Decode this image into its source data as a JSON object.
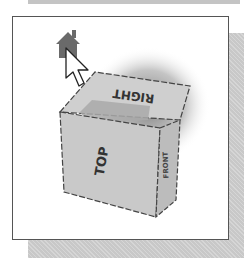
{
  "figure": {
    "faces": {
      "top_face_label": "RIGHT",
      "front_face_label": "TOP",
      "side_face_label": "FRONT"
    },
    "icons": [
      "home-icon",
      "arrow-cursor-icon"
    ],
    "colors": {
      "frame_border": "#555555",
      "shadow": "#c8c8c8",
      "cube_face": "#c9c9c9",
      "highlight_band": "#a8a8a8",
      "home_icon": "#6a6a6a"
    }
  }
}
